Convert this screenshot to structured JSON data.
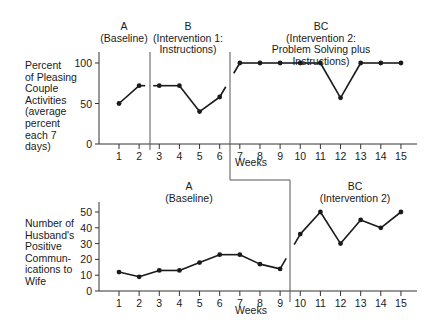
{
  "chart_data": [
    {
      "type": "line",
      "title": "",
      "ylabel": "Percent of Pleasing Couple Activities (average percent each 7 days)",
      "xlabel": "Weeks",
      "x": [
        1,
        2,
        3,
        4,
        5,
        6,
        7,
        8,
        9,
        10,
        11,
        12,
        13,
        14,
        15
      ],
      "series": [
        {
          "name": "Percent of Pleasing Couple Activities",
          "values": [
            50,
            72,
            72,
            72,
            40,
            58,
            100,
            100,
            100,
            100,
            100,
            57,
            100,
            100,
            100
          ]
        }
      ],
      "yticks": [
        0,
        50,
        100
      ],
      "ylim": [
        0,
        100
      ],
      "phases": [
        {
          "code": "A",
          "label": "(Baseline)",
          "weeks": [
            1,
            2
          ]
        },
        {
          "code": "B",
          "label": "(Intervention 1:\nInstructions)",
          "weeks": [
            3,
            6
          ]
        },
        {
          "code": "BC",
          "label": "(Intervention 2:\nProblem Solving plus Instructions)",
          "weeks": [
            7,
            15
          ]
        }
      ],
      "grid": false
    },
    {
      "type": "line",
      "title": "",
      "ylabel": "Number of Husband's Positive Communications to Wife",
      "xlabel": "Weeks",
      "x": [
        1,
        2,
        3,
        4,
        5,
        6,
        7,
        8,
        9,
        10,
        11,
        12,
        13,
        14,
        15
      ],
      "series": [
        {
          "name": "Husband's Positive Communications",
          "values": [
            12,
            9,
            13,
            13,
            18,
            23,
            23,
            17,
            14,
            36,
            50,
            30,
            45,
            40,
            50
          ]
        }
      ],
      "yticks": [
        0,
        10,
        20,
        30,
        40,
        50
      ],
      "ylim": [
        0,
        55
      ],
      "phases": [
        {
          "code": "A",
          "label": "(Baseline)",
          "weeks": [
            1,
            9
          ]
        },
        {
          "code": "BC",
          "label": "(Intervention 2)",
          "weeks": [
            10,
            15
          ]
        }
      ],
      "grid": false
    }
  ],
  "top": {
    "ylabel": "Percent\nof Pleasing\nCouple\nActivities\n(average\npercent\neach 7\ndays)",
    "xlabel": "Weeks",
    "phase_a": "A\n(Baseline)",
    "phase_b": "B\n(Intervention 1:\nInstructions)",
    "phase_bc": "BC\n(Intervention 2:\nProblem Solving plus Instructions)"
  },
  "bottom": {
    "ylabel": "Number of\nHusband's\nPositive\nCommun-\nications to\nWife",
    "xlabel": "Weeks",
    "phase_a": "A\n(Baseline)",
    "phase_bc": "BC\n(Intervention 2)"
  }
}
